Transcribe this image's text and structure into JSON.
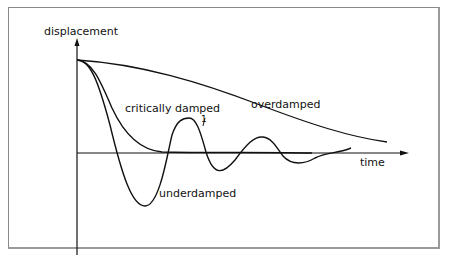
{
  "diagram": {
    "y_axis_label": "displacement",
    "x_axis_label": "time",
    "curves": [
      {
        "name": "overdamped",
        "label": "overdamped"
      },
      {
        "name": "critically-damped",
        "label": "critically damped"
      },
      {
        "name": "underdamped",
        "label": "underdamped"
      }
    ],
    "marker_label": "1",
    "line_color": "#111111",
    "frame_color": "#8a8a8a"
  }
}
